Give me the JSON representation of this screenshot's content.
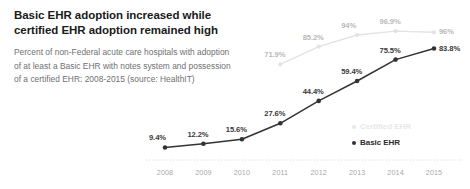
{
  "chart_data": {
    "type": "line",
    "title": "Basic EHR adoption increased while certified EHR adoption remained high",
    "subtitle": "Percent of non-Federal acute care hospitals with adoption of at least a Basic EHR with notes system and possession of a certified EHR: 2008-2015 (source: HealthIT)",
    "xlabel": "",
    "ylabel": "",
    "ylim": [
      0,
      100
    ],
    "grid": false,
    "legend_position": "right-inside",
    "categories": [
      "2008",
      "2009",
      "2010",
      "2011",
      "2012",
      "2013",
      "2014",
      "2015"
    ],
    "series": [
      {
        "name": "Certified EHR",
        "color": "#e3e3e3",
        "label_color": "#b9b9b9",
        "x": [
          "2011",
          "2012",
          "2013",
          "2014",
          "2015"
        ],
        "values": [
          71.9,
          85.2,
          94,
          96.9,
          96
        ],
        "data_labels": [
          "71.9%",
          "85.2%",
          "94%",
          "96.9%",
          "96%"
        ]
      },
      {
        "name": "Basic EHR",
        "color": "#333333",
        "label_color": "#3a3a3a",
        "x": [
          "2008",
          "2009",
          "2010",
          "2011",
          "2012",
          "2013",
          "2014",
          "2015"
        ],
        "values": [
          9.4,
          12.2,
          15.6,
          27.6,
          44.4,
          59.4,
          75.5,
          83.8
        ],
        "data_labels": [
          "9.4%",
          "12.2%",
          "15.6%",
          "27.6%",
          "44.4%",
          "59.4%",
          "75.5%",
          "83.8%"
        ]
      }
    ]
  },
  "legend": {
    "items": [
      {
        "label": "Certified EHR"
      },
      {
        "label": "Basic EHR"
      }
    ]
  },
  "axis": {
    "ticks": [
      "2008",
      "2009",
      "2010",
      "2011",
      "2012",
      "2013",
      "2014",
      "2015"
    ]
  },
  "colors": {
    "certified": "#e3e3e3",
    "basic": "#333333",
    "title": "#1a1a1a",
    "subtitle": "#6f6f6f",
    "axis_text": "#a9a9a9"
  }
}
